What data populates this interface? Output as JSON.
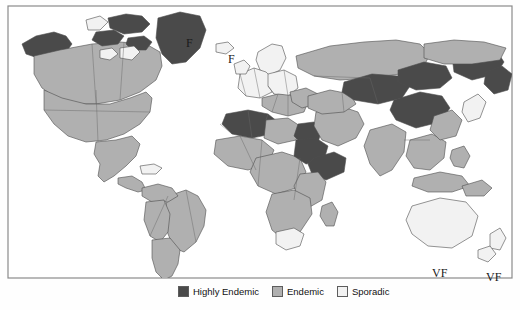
{
  "figure": {
    "type": "choropleth-world-map",
    "background_color": "#fefefe",
    "ocean_color": "#ffffff",
    "border_color": "#4d4d4d",
    "frame_color": "#7a7a7a"
  },
  "legend": {
    "items": [
      {
        "label": "Highly Endemic",
        "color": "#4a4a4a",
        "swatch_name": "legend-swatch-highly-endemic"
      },
      {
        "label": "Endemic",
        "color": "#b0b0b0",
        "swatch_name": "legend-swatch-endemic"
      },
      {
        "label": "Sporadic",
        "color": "#f2f2f2",
        "swatch_name": "legend-swatch-sporadic"
      }
    ]
  },
  "annotations": [
    {
      "text": "F",
      "name": "annotation-f-greenland",
      "x": 186,
      "y": 36
    },
    {
      "text": "F",
      "name": "annotation-f-iceland",
      "x": 228,
      "y": 52
    },
    {
      "text": "VF",
      "name": "annotation-vf-newzealand",
      "x": 432,
      "y": 266
    },
    {
      "text": "VF",
      "name": "annotation-vf-pacific",
      "x": 486,
      "y": 270
    }
  ],
  "classification": {
    "highly_endemic_regions": [
      "Alaska",
      "Northern Canada",
      "Greenland",
      "Northwestern Africa",
      "Egypt",
      "Sudan",
      "Ethiopia",
      "Somalia",
      "Central Asia",
      "Mongolia",
      "Northern China",
      "Eastern Siberia"
    ],
    "endemic_regions": [
      "United States",
      "Mexico",
      "Central America",
      "Brazil",
      "Peru",
      "Bolivia",
      "Chile",
      "Argentina",
      "Sub-Saharan Africa",
      "Middle East",
      "India",
      "Southeast Asia",
      "Russia",
      "Southern Europe"
    ],
    "sporadic_regions": [
      "Western Europe",
      "Scandinavia",
      "Japan",
      "Australia",
      "New Zealand",
      "Southern Africa"
    ]
  }
}
